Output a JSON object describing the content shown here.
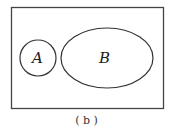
{
  "diagram": {
    "type": "venn",
    "universe": {
      "x": 11,
      "y": 7,
      "width": 153,
      "height": 101
    },
    "sets": [
      {
        "label": "A",
        "shape": "circle",
        "cx": 38,
        "cy": 58,
        "r": 18
      },
      {
        "label": "B",
        "shape": "ellipse",
        "cx": 107,
        "cy": 58,
        "rx": 46,
        "ry": 30
      }
    ],
    "shaded_region": "A ∩ B",
    "caption": "( b )",
    "colors": {
      "stroke": "#333333",
      "background": "#ffffff"
    }
  }
}
